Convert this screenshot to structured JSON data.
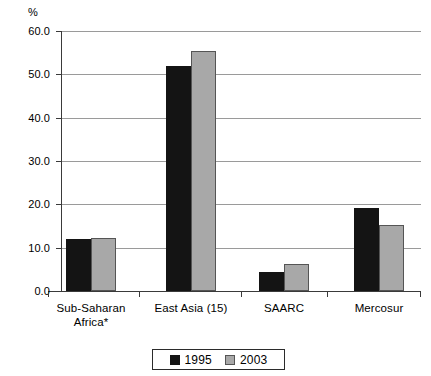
{
  "chart_data": {
    "type": "bar",
    "title": "",
    "xlabel": "",
    "ylabel": "%",
    "unit_label": "%",
    "categories": [
      "Sub-Saharan Africa*",
      "East Asia (15)",
      "SAARC",
      "Mercosur"
    ],
    "category_lines": [
      [
        "Sub-Saharan",
        "Africa*"
      ],
      [
        "East Asia (15)"
      ],
      [
        "SAARC"
      ],
      [
        "Mercosur"
      ]
    ],
    "series": [
      {
        "name": "1995",
        "color": "#141414",
        "values": [
          12.0,
          52.0,
          4.3,
          19.2
        ]
      },
      {
        "name": "2003",
        "color": "#a8a8a8",
        "values": [
          12.2,
          55.4,
          6.2,
          15.2
        ]
      }
    ],
    "ylim": [
      0.0,
      60.0
    ],
    "y_ticks": [
      0.0,
      10.0,
      20.0,
      30.0,
      40.0,
      50.0,
      60.0
    ],
    "y_tick_labels": [
      "0.0",
      "10.0",
      "20.0",
      "30.0",
      "40.0",
      "50.0",
      "60.0"
    ],
    "grid": true,
    "grid_axis": "y",
    "legend": {
      "position": "bottom-center",
      "entries": [
        {
          "label": "1995",
          "color": "#141414"
        },
        {
          "label": "2003",
          "color": "#a8a8a8"
        }
      ]
    }
  }
}
